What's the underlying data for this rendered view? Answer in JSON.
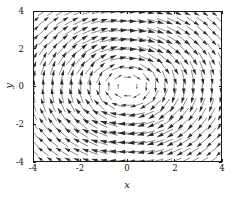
{
  "figure": {
    "title": "",
    "background_color": "#ffffff",
    "frame_color": "#1a1a1a",
    "arrow_color": "#2a2a2a"
  },
  "axes": {
    "xlabel": "x",
    "ylabel": "y",
    "xticks": [
      "-4",
      "-2",
      "0",
      "2",
      "4"
    ],
    "yticks": [
      "4",
      "2",
      "0",
      "-2",
      "-4"
    ]
  },
  "chart_data": {
    "type": "scatter",
    "plot_kind": "quiver",
    "title": "",
    "xlabel": "x",
    "ylabel": "y",
    "xlim": [
      -4,
      4
    ],
    "ylim": [
      -4,
      4
    ],
    "xticks": [
      -4,
      -2,
      0,
      2,
      4
    ],
    "yticks": [
      -4,
      -2,
      0,
      2,
      4
    ],
    "grid": false,
    "legend": "none",
    "field": {
      "u_expression": "y",
      "v_expression": "-x",
      "rotation": "clockwise",
      "center": [
        0,
        0
      ],
      "magnitude_profile": "proportional to radius, scaled by 1/(1+0.16*r*r)"
    },
    "grid_spec": {
      "nx": 21,
      "ny": 17,
      "x_start": -4,
      "x_end": 4,
      "y_start": -4,
      "y_end": 4
    },
    "arrow_style": {
      "max_length_data_units": 0.72,
      "head_length_fraction": 0.38,
      "head_half_angle_deg": 17
    }
  }
}
